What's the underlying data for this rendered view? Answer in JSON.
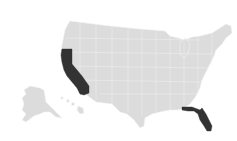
{
  "map": {
    "type": "choropleth",
    "region": "United States",
    "base_color": "#dcdcdc",
    "border_color": "#f4f4f4",
    "highlight_color": "#333333",
    "background_color": "#ffffff",
    "highlighted_states": [
      {
        "name": "California",
        "abbr": "CA"
      },
      {
        "name": "Florida",
        "abbr": "FL"
      }
    ],
    "insets": [
      "Alaska",
      "Hawaii"
    ]
  }
}
